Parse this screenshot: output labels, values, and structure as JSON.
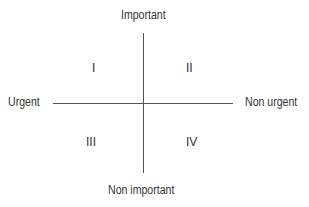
{
  "diagram": {
    "type": "quadrant-matrix",
    "axes": {
      "top": "Important",
      "bottom": "Non important",
      "left": "Urgent",
      "right": "Non urgent"
    },
    "quadrants": [
      {
        "label": "I",
        "position": "top-left"
      },
      {
        "label": "II",
        "position": "top-right"
      },
      {
        "label": "III",
        "position": "bottom-left"
      },
      {
        "label": "IV",
        "position": "bottom-right"
      }
    ],
    "colors": {
      "line": "#555555",
      "text": "#333333",
      "background": "#ffffff"
    }
  }
}
